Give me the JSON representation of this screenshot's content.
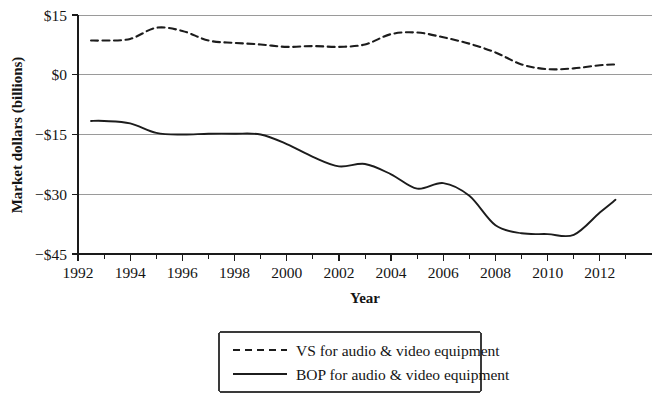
{
  "chart_data": {
    "type": "line",
    "title": "",
    "xlabel": "Year",
    "ylabel": "Market dollars (billions)",
    "xlim": [
      1992,
      2014
    ],
    "ylim": [
      -45,
      15
    ],
    "xticks": [
      1992,
      1994,
      1996,
      1998,
      2000,
      2002,
      2004,
      2006,
      2008,
      2010,
      2012
    ],
    "xtick_labels": [
      "1992",
      "1994",
      "1996",
      "1998",
      "2000",
      "2002",
      "2004",
      "2006",
      "2008",
      "2010",
      "2012"
    ],
    "xminor_ticks": [
      1993,
      1995,
      1997,
      1999,
      2001,
      2003,
      2005,
      2007,
      2009,
      2011,
      2013
    ],
    "yticks": [
      15,
      0,
      -15,
      -30,
      -45
    ],
    "ytick_labels": [
      "$15",
      "$0",
      "−$15",
      "−$30",
      "−$45"
    ],
    "grid": "horizontal",
    "legend_position": "below",
    "x": [
      1992.5,
      1993,
      1994,
      1995,
      1996,
      1997,
      1998,
      1999,
      2000,
      2001,
      2002,
      2003,
      2004,
      2005,
      2006,
      2007,
      2008,
      2009,
      2010,
      2011,
      2012,
      2012.6
    ],
    "series": [
      {
        "name": "VS for audio & video equipment",
        "style": "dashed",
        "color": "#1c1c1c",
        "values": [
          8.6,
          8.6,
          9.0,
          11.8,
          11.0,
          8.6,
          8.0,
          7.6,
          7.0,
          7.2,
          7.0,
          7.6,
          10.2,
          10.6,
          9.4,
          7.8,
          5.6,
          2.6,
          1.4,
          1.6,
          2.4,
          2.6
        ]
      },
      {
        "name": "BOP for audio & video equipment",
        "style": "solid",
        "color": "#1c1c1c",
        "values": [
          -11.6,
          -11.6,
          -12.2,
          -14.6,
          -15.0,
          -14.8,
          -14.8,
          -15.0,
          -17.4,
          -20.6,
          -23.0,
          -22.4,
          -25.0,
          -28.6,
          -27.2,
          -30.4,
          -37.8,
          -39.8,
          -40.0,
          -40.2,
          -34.6,
          -31.4
        ]
      }
    ],
    "legend": [
      {
        "label": "VS for audio & video equipment",
        "style": "dashed"
      },
      {
        "label": "BOP for audio & video equipment",
        "style": "solid"
      }
    ]
  }
}
